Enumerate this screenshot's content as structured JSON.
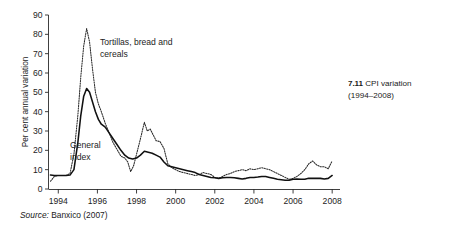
{
  "figure": {
    "number": "7.11",
    "title": "CPI variation",
    "years_range": "(1994–2008)",
    "source_prefix": "Source:",
    "source_text": "Banxico (2007)"
  },
  "chart_data": {
    "type": "line",
    "title": "CPI variation (1994–2008)",
    "xlabel": "",
    "ylabel": "Per cent annual variation",
    "xlim": [
      1993.5,
      2008.4
    ],
    "ylim": [
      0,
      90
    ],
    "grid": false,
    "legend": "inline-annotations",
    "ytick_labels": [
      "0",
      "10",
      "20",
      "30",
      "40",
      "50",
      "60",
      "70",
      "80",
      "90"
    ],
    "ytick_values": [
      0,
      10,
      20,
      30,
      40,
      50,
      60,
      70,
      80,
      90
    ],
    "xtick_labels": [
      "1994",
      "1996",
      "1998",
      "2000",
      "2002",
      "2004",
      "2006",
      "2008"
    ],
    "xtick_values": [
      1994,
      1996,
      1998,
      2000,
      2002,
      2004,
      2006,
      2008
    ],
    "series": [
      {
        "name": "Tortillas, bread and cereals",
        "style": "dotted",
        "annotation_label": "Tortillas, bread and cereals",
        "annotation_line1": "Tortillas, bread and",
        "annotation_line2": "cereals",
        "x": [
          1993.6,
          1993.8,
          1994.0,
          1994.2,
          1994.4,
          1994.6,
          1994.8,
          1995.0,
          1995.15,
          1995.3,
          1995.45,
          1995.6,
          1995.75,
          1995.9,
          1996.05,
          1996.2,
          1996.4,
          1996.6,
          1996.8,
          1997.0,
          1997.2,
          1997.4,
          1997.55,
          1997.7,
          1997.85,
          1998.0,
          1998.2,
          1998.4,
          1998.55,
          1998.7,
          1998.85,
          1999.0,
          1999.2,
          1999.4,
          1999.6,
          1999.8,
          2000.0,
          2000.2,
          2000.4,
          2000.6,
          2000.8,
          2001.0,
          2001.2,
          2001.4,
          2001.6,
          2001.8,
          2002.0,
          2002.2,
          2002.4,
          2002.6,
          2002.8,
          2003.0,
          2003.2,
          2003.4,
          2003.6,
          2003.8,
          2004.0,
          2004.2,
          2004.4,
          2004.6,
          2004.8,
          2005.0,
          2005.2,
          2005.4,
          2005.6,
          2005.8,
          2006.0,
          2006.2,
          2006.4,
          2006.6,
          2006.8,
          2007.0,
          2007.2,
          2007.4,
          2007.6,
          2007.8,
          2008.0
        ],
        "y": [
          4.0,
          6.5,
          7.0,
          7.0,
          7.0,
          8.0,
          18.0,
          38.0,
          58.0,
          74.0,
          83.0,
          76.0,
          62.0,
          50.0,
          44.0,
          40.0,
          34.0,
          29.0,
          24.0,
          20.5,
          17.0,
          16.0,
          14.0,
          9.0,
          12.0,
          18.0,
          26.0,
          34.5,
          30.0,
          31.0,
          28.0,
          25.0,
          24.5,
          21.0,
          13.0,
          11.0,
          10.0,
          9.0,
          8.5,
          8.0,
          7.5,
          7.0,
          7.5,
          8.5,
          8.0,
          7.5,
          6.0,
          5.5,
          6.5,
          7.5,
          8.0,
          9.0,
          9.5,
          10.0,
          9.5,
          10.5,
          10.0,
          10.5,
          11.0,
          10.5,
          10.0,
          9.0,
          8.0,
          7.0,
          6.0,
          5.0,
          5.5,
          6.5,
          8.0,
          10.0,
          13.0,
          14.5,
          12.5,
          11.5,
          11.5,
          10.5,
          14.5
        ]
      },
      {
        "name": "General index",
        "style": "solid",
        "annotation_label": "General index",
        "annotation_line1": "General",
        "annotation_line2": "index",
        "x": [
          1993.6,
          1993.8,
          1994.0,
          1994.2,
          1994.4,
          1994.6,
          1994.8,
          1995.0,
          1995.15,
          1995.3,
          1995.45,
          1995.6,
          1995.75,
          1995.9,
          1996.05,
          1996.2,
          1996.4,
          1996.6,
          1996.8,
          1997.0,
          1997.2,
          1997.4,
          1997.6,
          1997.8,
          1998.0,
          1998.2,
          1998.4,
          1998.6,
          1998.8,
          1999.0,
          1999.2,
          1999.4,
          1999.6,
          1999.8,
          2000.0,
          2000.2,
          2000.4,
          2000.6,
          2000.8,
          2001.0,
          2001.2,
          2001.4,
          2001.6,
          2001.8,
          2002.0,
          2002.2,
          2002.4,
          2002.6,
          2002.8,
          2003.0,
          2003.2,
          2003.4,
          2003.6,
          2003.8,
          2004.0,
          2004.2,
          2004.4,
          2004.6,
          2004.8,
          2005.0,
          2005.2,
          2005.4,
          2005.6,
          2005.8,
          2006.0,
          2006.2,
          2006.4,
          2006.6,
          2006.8,
          2007.0,
          2007.2,
          2007.4,
          2007.6,
          2007.8,
          2008.0
        ],
        "y": [
          7.2,
          7.0,
          7.0,
          7.0,
          7.0,
          7.2,
          10.0,
          24.0,
          38.0,
          48.0,
          52.0,
          50.0,
          45.0,
          40.0,
          36.0,
          33.5,
          32.0,
          29.0,
          26.0,
          23.0,
          20.0,
          17.5,
          16.0,
          15.5,
          16.0,
          17.5,
          19.5,
          19.0,
          18.5,
          17.5,
          16.5,
          14.0,
          12.0,
          11.5,
          11.0,
          10.5,
          10.0,
          9.5,
          9.0,
          8.5,
          7.5,
          7.0,
          6.5,
          6.0,
          5.8,
          5.5,
          5.8,
          6.0,
          6.0,
          5.8,
          5.5,
          5.2,
          5.5,
          6.0,
          6.0,
          6.2,
          6.5,
          6.5,
          6.0,
          5.5,
          5.0,
          4.8,
          4.5,
          4.5,
          5.0,
          5.2,
          5.0,
          5.0,
          5.5,
          5.5,
          5.5,
          5.5,
          5.2,
          5.5,
          7.0
        ]
      }
    ]
  }
}
